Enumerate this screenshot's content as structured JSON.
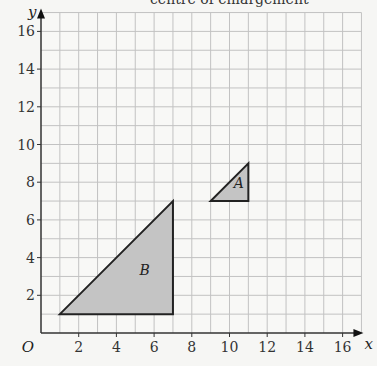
{
  "caption": "centre of enlargement",
  "chart_data": {
    "type": "diagram",
    "title": "",
    "xlabel": "x",
    "ylabel": "y",
    "origin_label": "O",
    "xlim": [
      0,
      17
    ],
    "ylim": [
      0,
      17
    ],
    "grid": true,
    "x_ticks": [
      2,
      4,
      6,
      8,
      10,
      12,
      14,
      16
    ],
    "y_ticks": [
      2,
      4,
      6,
      8,
      10,
      12,
      14,
      16
    ],
    "shapes": [
      {
        "label": "A",
        "type": "triangle",
        "vertices": [
          [
            9,
            7
          ],
          [
            11,
            7
          ],
          [
            11,
            9
          ]
        ],
        "fill": "#c4c4c4",
        "label_pos": [
          10.5,
          7.7
        ]
      },
      {
        "label": "B",
        "type": "triangle",
        "vertices": [
          [
            1,
            1
          ],
          [
            7,
            1
          ],
          [
            7,
            7
          ]
        ],
        "fill": "#c4c4c4",
        "label_pos": [
          5.5,
          3.1
        ]
      }
    ]
  },
  "colors": {
    "background": "#f6f6f4",
    "grid": "#c2c2c2",
    "axis": "#333333",
    "shape_fill": "#c4c4c4",
    "shape_stroke": "#222222"
  }
}
